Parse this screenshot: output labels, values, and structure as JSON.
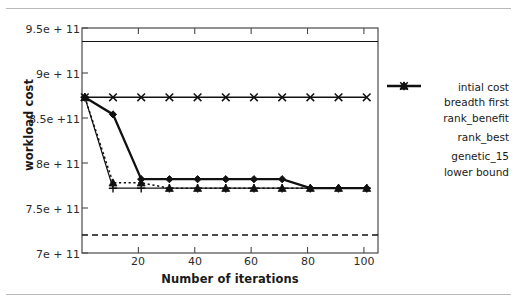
{
  "chart_data": {
    "type": "line",
    "title": "",
    "xlabel": "Number of iterations",
    "ylabel": "workload cost",
    "xlim": [
      0,
      105
    ],
    "ylim": [
      700000000000.0,
      950000000000.0
    ],
    "grid": false,
    "legend_position": "right",
    "x_ticks": [
      20,
      40,
      60,
      80,
      100
    ],
    "x_tick_labels": [
      "20",
      "40",
      "60",
      "80",
      "100"
    ],
    "y_ticks": [
      700000000000.0,
      750000000000.0,
      800000000000.0,
      850000000000.0,
      900000000000.0,
      950000000000.0
    ],
    "y_tick_labels": [
      "7e + 11",
      "7.5e + 11",
      "8e + 11",
      "8.5e +11",
      "9e + 11",
      "9.5e + 11"
    ],
    "series": [
      {
        "name": "intial cost",
        "style": "solid",
        "marker": "none",
        "x": [
          0,
          105
        ],
        "values": [
          935000000000.0,
          935000000000.0
        ]
      },
      {
        "name": "breadth first",
        "style": "solid",
        "marker": "diamond",
        "x": [
          1,
          11,
          21,
          31,
          41,
          51,
          61,
          71,
          81,
          91,
          101
        ],
        "values": [
          873000000000.0,
          854000000000.0,
          782000000000.0,
          782000000000.0,
          782000000000.0,
          782000000000.0,
          782000000000.0,
          782000000000.0,
          772000000000.0,
          772000000000.0,
          772000000000.0
        ]
      },
      {
        "name": "rank_benefit",
        "style": "solid",
        "marker": "x",
        "x": [
          1,
          11,
          21,
          31,
          41,
          51,
          61,
          71,
          81,
          91,
          101
        ],
        "values": [
          873000000000.0,
          873000000000.0,
          873000000000.0,
          873000000000.0,
          873000000000.0,
          873000000000.0,
          873000000000.0,
          873000000000.0,
          873000000000.0,
          873000000000.0,
          873000000000.0
        ]
      },
      {
        "name": "rank_best",
        "style": "solid",
        "marker": "plus",
        "x": [
          1,
          11,
          21,
          31,
          41,
          51,
          61,
          71,
          81,
          91,
          101
        ],
        "values": [
          873000000000.0,
          772000000000.0,
          772000000000.0,
          772000000000.0,
          772000000000.0,
          772000000000.0,
          772000000000.0,
          772000000000.0,
          772000000000.0,
          772000000000.0,
          772000000000.0
        ]
      },
      {
        "name": "genetic_15",
        "style": "dotted",
        "marker": "triangle",
        "x": [
          1,
          11,
          21,
          31,
          41,
          51,
          61,
          71,
          81,
          91,
          101
        ],
        "values": [
          873000000000.0,
          778000000000.0,
          778000000000.0,
          772000000000.0,
          772000000000.0,
          772000000000.0,
          772000000000.0,
          772000000000.0,
          772000000000.0,
          772000000000.0,
          772000000000.0
        ]
      },
      {
        "name": "lower bound",
        "style": "dashed",
        "marker": "none",
        "x": [
          0,
          105
        ],
        "values": [
          720000000000.0,
          720000000000.0
        ]
      }
    ]
  },
  "legend": {
    "entries": [
      {
        "label": "intial cost",
        "key": "line-plain"
      },
      {
        "label": "breadth first",
        "key": "line-diamond"
      },
      {
        "label": "rank_benefit",
        "key": "line-x"
      },
      {
        "label": "rank_best",
        "key": "line-plus"
      },
      {
        "label": "genetic_15",
        "key": "dotted-triangle"
      },
      {
        "label": "lower bound",
        "key": "dashed-plain"
      }
    ]
  },
  "colors": {
    "ink": "#1a1a1a",
    "axis": "#4a4a4a",
    "rule": "#b9b9b9",
    "background": "#ffffff"
  }
}
